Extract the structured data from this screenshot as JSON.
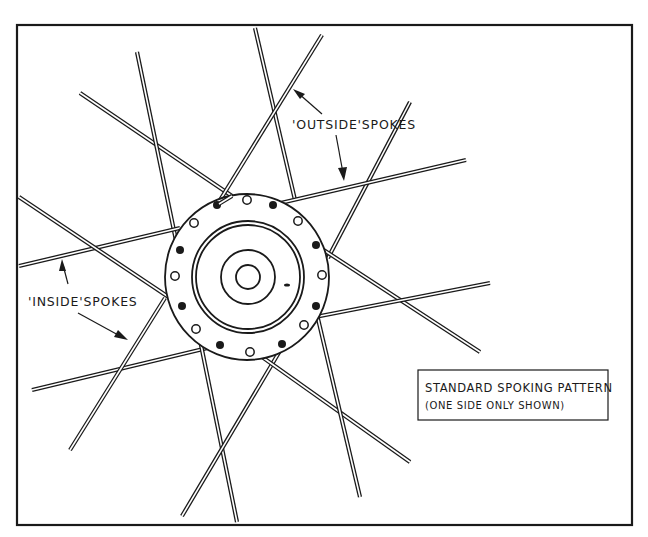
{
  "diagram": {
    "title": "Standard spoking pattern",
    "labels": {
      "outside_spokes": "'OUTSIDE'SPOKES",
      "inside_spokes": "'INSIDE'SPOKES"
    },
    "caption": {
      "line1": "STANDARD SPOKING PATTERN",
      "line2": "(ONE SIDE ONLY SHOWN)"
    },
    "hub": {
      "center": [
        238,
        272
      ],
      "flange_radius": 72,
      "spoke_hole_count": 16
    },
    "colors": {
      "ink": "#1a1a1a",
      "paper": "#ffffff"
    }
  }
}
